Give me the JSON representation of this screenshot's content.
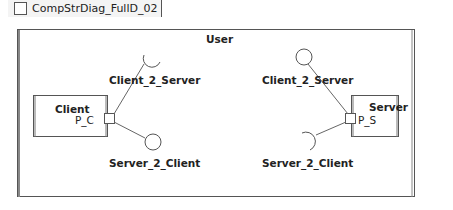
{
  "tab": {
    "icon": "composite-structure-diagram-icon",
    "label": "CompStrDiag_FullD_02"
  },
  "diagram": {
    "container": {
      "label": "User"
    },
    "parts": [
      {
        "label": "Client",
        "port": "P_C"
      },
      {
        "label": "Server",
        "port": "P_S"
      }
    ],
    "interfaces": {
      "left_top": "Client_2_Server",
      "left_bottom": "Server_2_Client",
      "right_top": "Client_2_Server",
      "right_bottom": "Server_2_Client"
    }
  }
}
